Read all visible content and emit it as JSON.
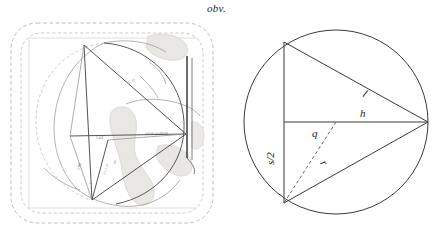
{
  "figure": {
    "caption": "obv.",
    "panels": [
      "tablet-hand-copy",
      "geometric-construction"
    ]
  },
  "left_panel": {
    "name": "tablet-hand-copy",
    "description": "obverse of a clay tablet hand copy with dashed break outlines, inscribed construction lines and cuneiform annotations",
    "annotations": [
      {
        "id": "a1",
        "text": "5· 33",
        "x": 121,
        "y": 66,
        "rotate": -31
      },
      {
        "id": "a2",
        "text": "šaš-lak.gu-am-ru",
        "x": 137,
        "y": 117,
        "rotate": -3
      },
      {
        "id": "a3",
        "text": "5·4 8",
        "x": 88,
        "y": 121,
        "rotate": 0
      },
      {
        "id": "a4",
        "text": "2 sag",
        "x": 72,
        "y": 152,
        "rotate": -90
      },
      {
        "id": "a5",
        "text": "3 1·1 3ⁱ⁵",
        "x": 97,
        "y": 157,
        "rotate": -72
      },
      {
        "id": "a6",
        "text": "nu",
        "x": 107,
        "y": 146,
        "rotate": -72
      },
      {
        "id": "a7",
        "text": "1′",
        "x": 84,
        "y": 166,
        "rotate": -90
      }
    ],
    "colors": {
      "dashed_outline": "#b3b3b3",
      "construction_line": "#4d4d4d",
      "tablet_line": "#8c8c8c",
      "damage_fill": "#e6e4e0",
      "edge_dark": "#3d3d3d"
    }
  },
  "right_panel": {
    "name": "geometric-construction",
    "labels": {
      "l": "l",
      "h": "h",
      "q": "q",
      "r": "r",
      "s_half": "s/2"
    },
    "colors": {
      "circle": "#3a3a3a",
      "chord": "#3a3a3a",
      "dashed_radius": "#555555"
    }
  },
  "geometry": {
    "circle": {
      "cx": 100,
      "cy": 102,
      "r": 92
    },
    "points": {
      "top_vertex": {
        "x": 48,
        "y": 22,
        "name": "A"
      },
      "bottom_vertex": {
        "x": 48,
        "y": 183,
        "name": "B"
      },
      "right_vertex": {
        "x": 192,
        "y": 102,
        "name": "C"
      },
      "chord_midpoint": {
        "x": 48,
        "y": 102,
        "name": "M"
      }
    },
    "segments": [
      {
        "name": "chord-s",
        "from": "A",
        "to": "B",
        "label": "s/2"
      },
      {
        "name": "hypotenuse-upper",
        "from": "A",
        "to": "C",
        "label": "l"
      },
      {
        "name": "hypotenuse-lower",
        "from": "B",
        "to": "C",
        "label": "l"
      },
      {
        "name": "axis-h",
        "from": "M",
        "to": "C",
        "label": "h"
      },
      {
        "name": "sagitta-q",
        "from": "M",
        "to": "center",
        "label": "q"
      },
      {
        "name": "radius-r",
        "from": "center",
        "to": "B",
        "label": "r",
        "style": "dashed"
      }
    ]
  }
}
